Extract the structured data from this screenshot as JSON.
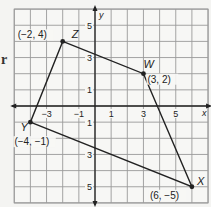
{
  "figure": {
    "type": "coordinate-plane-quadrilateral",
    "edge_text_fragment": "r",
    "grid": {
      "xmin": -5,
      "xmax": 7,
      "ymin": -6,
      "ymax": 6,
      "step": 1
    },
    "axes": {
      "x_label": "x",
      "y_label": "y",
      "x_ticks": [
        {
          "value": -3,
          "label": "−3"
        },
        {
          "value": -1,
          "label": "−1"
        },
        {
          "value": 1,
          "label": "1"
        },
        {
          "value": 3,
          "label": "3"
        },
        {
          "value": 5,
          "label": "5"
        }
      ],
      "y_ticks": [
        {
          "value": 5,
          "label": "5"
        },
        {
          "value": 3,
          "label": "3"
        },
        {
          "value": 1,
          "label": "1"
        },
        {
          "value": -1,
          "label": "1"
        },
        {
          "value": -3,
          "label": "3"
        },
        {
          "value": -5,
          "label": "5"
        }
      ]
    },
    "points": [
      {
        "name": "Z",
        "x": -2,
        "y": 4,
        "coord_label": "(−2, 4)"
      },
      {
        "name": "W",
        "x": 3,
        "y": 2,
        "coord_label": "(3, 2)"
      },
      {
        "name": "X",
        "x": 6,
        "y": -5,
        "coord_label": "(6, −5)"
      },
      {
        "name": "Y",
        "x": -4,
        "y": -1,
        "coord_label": "(−4, −1)"
      }
    ],
    "polygon_order": [
      "Z",
      "W",
      "X",
      "Y"
    ],
    "colors": {
      "grid": "#9a9a9a",
      "axis": "#222222",
      "polygon": "#222222",
      "background": "#f4f4f2"
    }
  }
}
